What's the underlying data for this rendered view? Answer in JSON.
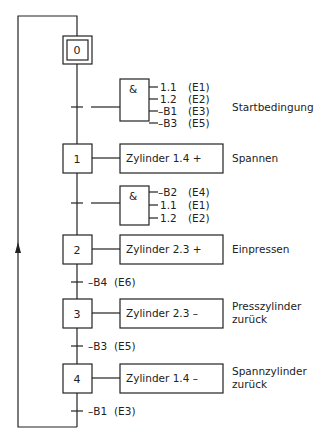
{
  "diagram": {
    "type": "GRAFCET sequential function chart",
    "steps": [
      {
        "id": "0",
        "initial": true
      },
      {
        "id": "1",
        "action": "Zylinder 1.4 +",
        "comment": "Spannen"
      },
      {
        "id": "2",
        "action": "Zylinder 2.3 +",
        "comment": "Einpressen"
      },
      {
        "id": "3",
        "action": "Zylinder 2.3 –",
        "comment_line1": "Presszylinder",
        "comment_line2": "zurück"
      },
      {
        "id": "4",
        "action": "Zylinder 1.4 –",
        "comment_line1": "Spannzylinder",
        "comment_line2": "zurück"
      }
    ],
    "transitions": [
      {
        "from": "0",
        "to": "1",
        "gate": "&",
        "inputs": [
          {
            "signal": "1.1",
            "address": "(E1)"
          },
          {
            "signal": "1.2",
            "address": "(E2)"
          },
          {
            "signal": "–B1",
            "address": "(E3)"
          },
          {
            "signal": "–B3",
            "address": "(E5)"
          }
        ],
        "comment": "Startbedingung"
      },
      {
        "from": "1",
        "to": "2",
        "gate": "&",
        "inputs": [
          {
            "signal": "–B2",
            "address": "(E4)"
          },
          {
            "signal": "1.1",
            "address": "(E1)"
          },
          {
            "signal": "1.2",
            "address": "(E2)"
          }
        ]
      },
      {
        "from": "2",
        "to": "3",
        "condition": "–B4",
        "address": "(E6)"
      },
      {
        "from": "3",
        "to": "4",
        "condition": "–B3",
        "address": "(E5)"
      },
      {
        "from": "4",
        "to": "0",
        "condition": "–B1",
        "address": "(E3)"
      }
    ],
    "colors": {
      "line": "#222222",
      "background": "#ffffff"
    }
  }
}
